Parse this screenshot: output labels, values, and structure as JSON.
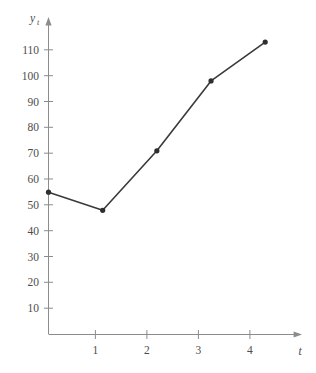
{
  "chart_data": {
    "type": "line",
    "title": "",
    "subtitle": "",
    "xlabel": "t",
    "ylabel": "y_t",
    "ylabel_base": "y",
    "ylabel_sub": "t",
    "x": [
      0,
      1,
      2,
      3,
      4
    ],
    "values": [
      55,
      48,
      71,
      98,
      113
    ],
    "series": [
      {
        "name": "y_t",
        "values": [
          55,
          48,
          71,
          98,
          113
        ]
      }
    ],
    "xlim": [
      0,
      4.55
    ],
    "ylim": [
      0,
      120
    ],
    "xticks": [
      1,
      2,
      3,
      4
    ],
    "xtick_labels": [
      "1",
      "2",
      "3",
      "4"
    ],
    "yticks": [
      10,
      20,
      30,
      40,
      50,
      60,
      70,
      80,
      90,
      100,
      110
    ],
    "ytick_labels": [
      "10",
      "20",
      "30",
      "40",
      "50",
      "60",
      "70",
      "80",
      "90",
      "100",
      "110"
    ],
    "grid": false,
    "legend": false,
    "legend_position": "none",
    "marker": "filled-circle",
    "line_color": "#3a3a3a",
    "marker_color": "#2e2e2e",
    "axis_color": "#8c8c8c",
    "text_color": "#4d4d4d",
    "background_color": "#ffffff"
  },
  "caption": {
    "text": ""
  }
}
